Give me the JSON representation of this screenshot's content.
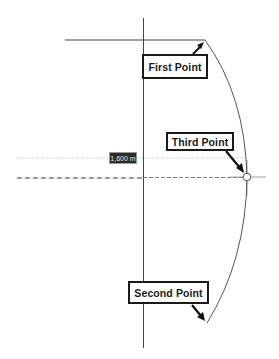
{
  "diagram": {
    "type": "three-point-arc-construction",
    "callouts": {
      "first_point": "First Point",
      "second_point": "Second Point",
      "third_point": "Third Point"
    },
    "dimension_label": "1,600 m",
    "colors": {
      "line": "#333333",
      "callout_border": "#1a1a1a",
      "dimension_bg": "#2b2b2b",
      "dimension_text": "#e8e8e8",
      "guide": "#999999"
    }
  }
}
